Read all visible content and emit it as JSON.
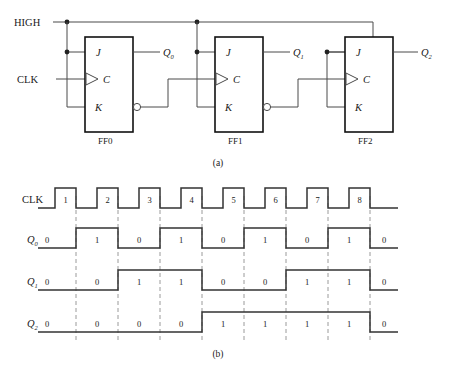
{
  "figure": {
    "caption_a": "(a)",
    "caption_b": "(b)"
  },
  "circuit": {
    "supply_label": "HIGH",
    "clock_label": "CLK",
    "flipflops": [
      {
        "name": "FF0",
        "j": "J",
        "k": "K",
        "c": "C",
        "q": "Q",
        "q_sub": "0",
        "has_qbar_bubble": true
      },
      {
        "name": "FF1",
        "j": "J",
        "k": "K",
        "c": "C",
        "q": "Q",
        "q_sub": "1",
        "has_qbar_bubble": true
      },
      {
        "name": "FF2",
        "j": "J",
        "k": "K",
        "c": "C",
        "q": "Q",
        "q_sub": "2",
        "has_qbar_bubble": false
      }
    ]
  },
  "timing": {
    "clock_label": "CLK",
    "pulse_numbers": [
      "1",
      "2",
      "3",
      "4",
      "5",
      "6",
      "7",
      "8"
    ],
    "rows": [
      {
        "name": "Q",
        "sub": "0",
        "initial": "0",
        "values": [
          "1",
          "0",
          "1",
          "0",
          "1",
          "0",
          "1",
          "0"
        ]
      },
      {
        "name": "Q",
        "sub": "1",
        "initial": "0",
        "values": [
          "0",
          "1",
          "1",
          "0",
          "0",
          "1",
          "1",
          "0"
        ]
      },
      {
        "name": "Q",
        "sub": "2",
        "initial": "0",
        "values": [
          "0",
          "0",
          "0",
          "1",
          "1",
          "1",
          "1",
          "0"
        ]
      }
    ]
  },
  "chart_data": {
    "type": "line",
    "xlabel": "Clock pulse",
    "ylabel": "Logic level",
    "x": [
      1,
      2,
      3,
      4,
      5,
      6,
      7,
      8
    ],
    "categories": [
      "1",
      "2",
      "3",
      "4",
      "5",
      "6",
      "7",
      "8"
    ],
    "series": [
      {
        "name": "CLK",
        "values": [
          1,
          1,
          1,
          1,
          1,
          1,
          1,
          1
        ],
        "note": "square wave, eight pulses, toggles high then low each period"
      },
      {
        "name": "Q0",
        "initial": 0,
        "values": [
          1,
          0,
          1,
          0,
          1,
          0,
          1,
          0
        ]
      },
      {
        "name": "Q1",
        "initial": 0,
        "values": [
          0,
          1,
          1,
          0,
          0,
          1,
          1,
          0
        ]
      },
      {
        "name": "Q2",
        "initial": 0,
        "values": [
          0,
          0,
          0,
          1,
          1,
          1,
          1,
          0
        ]
      }
    ],
    "ylim": [
      0,
      1
    ],
    "grid": true,
    "grid_note": "vertical dashed lines at each clock falling edge",
    "legend": "none"
  }
}
